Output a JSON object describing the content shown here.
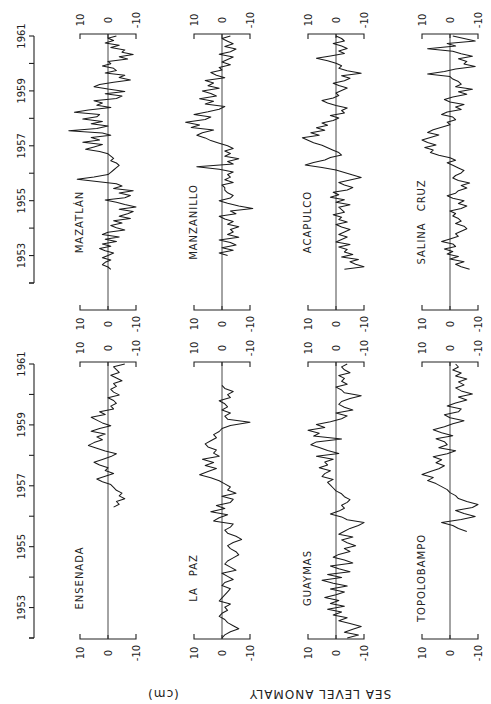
{
  "chart_data": {
    "type": "line",
    "orientation_note": "figure rotated 90 degrees; time runs bottom-to-top, anomaly positive to the left",
    "ylabel": "SEA LEVEL ANOMALY",
    "yunit": "(cm)",
    "time_axis": {
      "tick_labels": [
        "1953",
        "1955",
        "1957",
        "1959",
        "1961"
      ],
      "range": [
        1952,
        1961
      ]
    },
    "anomaly_axis": {
      "tick_labels": [
        "10",
        "0",
        "-10"
      ],
      "range": [
        -10,
        10
      ]
    },
    "rows": [
      {
        "row": "top",
        "panels": [
          {
            "name": "MAZATLÁN",
            "t_start": 1952.5,
            "t_end": 1961.0,
            "values": [
              -1,
              0,
              2,
              1,
              -1,
              2,
              0,
              -2,
              1,
              3,
              -1,
              2,
              -3,
              1,
              -4,
              2,
              0,
              -6,
              -3,
              -1,
              -5,
              -2,
              -8,
              -4,
              -7,
              -9,
              -4,
              -10,
              -6,
              -3,
              1,
              -6,
              -8,
              -4,
              -9,
              -2,
              -5,
              -3,
              4,
              11,
              5,
              0,
              -1,
              -2,
              -3,
              -4,
              -3,
              -1,
              -2,
              -1,
              0,
              3,
              8,
              5,
              2,
              9,
              3,
              6,
              -1,
              2,
              14,
              4,
              0,
              6,
              2,
              9,
              4,
              3,
              12,
              7,
              -1,
              4,
              2,
              5,
              -3,
              -5,
              1,
              -6,
              0,
              5,
              3,
              -2,
              -8,
              -4,
              -6,
              1,
              -3,
              -2,
              2,
              -1,
              0,
              -7,
              -4,
              -9,
              -5,
              -6,
              -1,
              -4,
              1,
              -2,
              0,
              -3
            ]
          },
          {
            "name": "MANZANILLO",
            "t_start": 1953.0,
            "t_end": 1961.0,
            "values": [
              -2,
              1,
              -4,
              0,
              -5,
              -3,
              1,
              -6,
              -2,
              -4,
              -3,
              -6,
              -2,
              -4,
              -1,
              1,
              -5,
              -3,
              -11,
              -6,
              -2,
              1,
              -3,
              -4,
              -2,
              -1,
              -1,
              0,
              -4,
              -1,
              -3,
              -2,
              -4,
              1,
              9,
              -4,
              -2,
              -6,
              -1,
              -3,
              -1,
              -4,
              -2,
              1,
              4,
              6,
              9,
              7,
              3,
              11,
              8,
              13,
              6,
              4,
              10,
              5,
              1,
              -1,
              6,
              3,
              8,
              2,
              4,
              7,
              1,
              5,
              3,
              6,
              -1,
              2,
              4,
              0,
              1,
              -3,
              0,
              -2,
              -4,
              1,
              -3,
              -5,
              -1,
              -4,
              -2,
              0,
              -3
            ]
          },
          {
            "name": "ACAPULCO",
            "t_start": 1952.5,
            "t_end": 1961.0,
            "values": [
              -3,
              -10,
              -7,
              -5,
              -8,
              -2,
              -6,
              -3,
              -4,
              -1,
              -5,
              0,
              -2,
              -4,
              -1,
              -3,
              -5,
              -2,
              0,
              -4,
              -1,
              -2,
              1,
              -3,
              -2,
              -1,
              -5,
              0,
              -3,
              2,
              -1,
              1,
              -4,
              -6,
              -3,
              -1,
              -5,
              -9,
              -6,
              -3,
              0,
              5,
              11,
              8,
              4,
              2,
              -2,
              -1,
              1,
              3,
              5,
              8,
              10,
              12,
              6,
              9,
              4,
              7,
              3,
              5,
              1,
              -1,
              2,
              -3,
              -2,
              -4,
              0,
              3,
              5,
              1,
              -1,
              0,
              -2,
              -4,
              -1,
              1,
              -3,
              -5,
              -2,
              -9,
              -4,
              -1,
              -2,
              0,
              3,
              7,
              2,
              -3,
              -1,
              -4,
              -2,
              1,
              -3,
              -2,
              0
            ]
          },
          {
            "name": "SALINA CRUZ",
            "t_start": 1952.5,
            "t_end": 1961.0,
            "values": [
              -7,
              -4,
              -2,
              -5,
              0,
              -3,
              1,
              -1,
              2,
              -2,
              -1,
              3,
              0,
              -3,
              -2,
              -4,
              -6,
              -5,
              -2,
              -4,
              -3,
              -1,
              -2,
              0,
              -4,
              -6,
              -3,
              -5,
              -1,
              1,
              -2,
              -3,
              -6,
              -4,
              -7,
              -3,
              -1,
              -2,
              -4,
              -5,
              -3,
              -1,
              1,
              -2,
              0,
              4,
              7,
              6,
              9,
              5,
              8,
              10,
              7,
              4,
              8,
              6,
              3,
              0,
              1,
              -2,
              -1,
              3,
              1,
              -4,
              -2,
              -5,
              0,
              2,
              -1,
              -6,
              -3,
              -8,
              -2,
              -4,
              -3,
              -1,
              0,
              8,
              2,
              -2,
              -9,
              -5,
              -6,
              -3,
              -8,
              -4,
              -1,
              8,
              -2,
              1,
              -9,
              -5,
              -1
            ]
          }
        ]
      },
      {
        "row": "bottom",
        "panels": [
          {
            "name": "ENSENADA",
            "t_start": 1956.3,
            "t_end": 1961.0,
            "values": [
              -2,
              -4,
              -3,
              -6,
              -4,
              -5,
              -3,
              -2,
              -1,
              2,
              4,
              1,
              -2,
              1,
              0,
              3,
              5,
              2,
              -1,
              -3,
              1,
              4,
              7,
              5,
              2,
              4,
              1,
              6,
              3,
              -1,
              2,
              4,
              6,
              1,
              3,
              -2,
              -1,
              -3,
              -2,
              0,
              -4,
              -2,
              -1,
              -3,
              -2,
              -5,
              -3,
              -1,
              -4,
              -3,
              -2,
              -6
            ]
          },
          {
            "name": "LA PAZ",
            "t_start": 1952.0,
            "t_end": 1960.3,
            "values": [
              0,
              -1,
              -3,
              -6,
              -4,
              -2,
              -1,
              1,
              0,
              -2,
              -1,
              -3,
              1,
              0,
              -1,
              -2,
              -3,
              0,
              -1,
              -4,
              -2,
              0,
              -5,
              -3,
              -1,
              -2,
              -4,
              -6,
              -5,
              -3,
              -2,
              -4,
              -7,
              -5,
              -2,
              -1,
              -3,
              -4,
              3,
              1,
              -2,
              4,
              -1,
              2,
              -3,
              -4,
              0,
              -5,
              -2,
              -3,
              -1,
              1,
              4,
              8,
              5,
              2,
              6,
              3,
              7,
              1,
              3,
              2,
              5,
              6,
              4,
              2,
              3,
              1,
              0,
              -3,
              -10,
              -2,
              -1,
              -3,
              0,
              -2,
              -1,
              1,
              -3,
              -2,
              -4,
              -1,
              0
            ]
          },
          {
            "name": "GUAYMAS",
            "t_start": 1952.0,
            "t_end": 1961.0,
            "values": [
              -4,
              -8,
              -3,
              -6,
              -9,
              -5,
              -1,
              -4,
              1,
              -2,
              3,
              -3,
              2,
              -1,
              4,
              0,
              -3,
              2,
              -4,
              1,
              5,
              -2,
              3,
              -5,
              -1,
              2,
              -6,
              -3,
              1,
              -1,
              -5,
              -3,
              -7,
              -4,
              -2,
              -6,
              -1,
              -3,
              -5,
              -8,
              -10,
              -4,
              -2,
              2,
              -1,
              -3,
              -2,
              -4,
              -5,
              -3,
              -2,
              0,
              1,
              2,
              3,
              1,
              5,
              4,
              2,
              6,
              3,
              4,
              1,
              7,
              -1,
              3,
              6,
              9,
              7,
              -2,
              8,
              6,
              10,
              4,
              7,
              2,
              -2,
              -4,
              0,
              -6,
              -3,
              -1,
              -2,
              -5,
              -9,
              -3,
              -2,
              0,
              -4,
              -2,
              -3,
              -1,
              -5,
              -3,
              -2,
              -4
            ]
          },
          {
            "name": "TOPOLOBAMPO",
            "t_start": 1955.5,
            "t_end": 1961.0,
            "values": [
              -6,
              -3,
              -1,
              3,
              -4,
              -9,
              -5,
              -2,
              -8,
              -10,
              -6,
              -3,
              -2,
              0,
              1,
              3,
              5,
              8,
              6,
              10,
              7,
              4,
              2,
              5,
              3,
              6,
              1,
              -2,
              4,
              1,
              2,
              5,
              -1,
              3,
              6,
              2,
              -1,
              -5,
              0,
              2,
              -3,
              -4,
              1,
              -2,
              -6,
              -3,
              -8,
              -4,
              -2,
              -5,
              -3,
              -6,
              -2,
              -4,
              -1,
              -3,
              -2
            ]
          }
        ]
      }
    ]
  },
  "layout_ref": {
    "rows": [
      {
        "y_1952": 283,
        "y_1961": 36,
        "bracket_top": 34,
        "bracket_bottom": 310
      },
      {
        "y_1952": 638,
        "y_1961": 364,
        "bracket_top": 362,
        "bracket_bottom": 639
      }
    ],
    "columns_zero_x": [
      108,
      222,
      336,
      450
    ],
    "px_per_10cm": 28,
    "time_axis_x": 34
  }
}
